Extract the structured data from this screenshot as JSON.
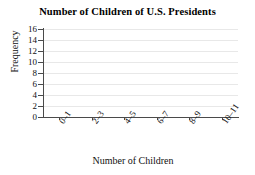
{
  "chart_data": {
    "type": "bar",
    "title": "Number of Children of U.S. Presidents",
    "xlabel": "Number of Children",
    "ylabel": "Frequency",
    "categories": [
      "0–1",
      "2–3",
      "4–5",
      "6–7",
      "8–9",
      "10–11"
    ],
    "values": [
      null,
      null,
      null,
      null,
      null,
      null
    ],
    "series": [
      {
        "name": "Frequency",
        "values": [
          null,
          null,
          null,
          null,
          null,
          null
        ]
      }
    ],
    "ylim": [
      0,
      16
    ],
    "y_ticks": [
      0,
      2,
      4,
      6,
      8,
      10,
      12,
      14,
      16
    ],
    "y_tick_labels": [
      "0",
      "2",
      "4",
      "6",
      "8",
      "10",
      "12",
      "14",
      "16"
    ],
    "x_tick_labels": [
      "0–1",
      "2–3",
      "4–5",
      "6–7",
      "8–9",
      "10–11"
    ],
    "x_tick_label_rotation": -55,
    "grid": true,
    "grid_axis": "y",
    "legend": false,
    "legend_position": "none",
    "bars_drawn": false,
    "annotations": [],
    "colors": {
      "background": "#ffffff",
      "axis": "#4a4a4a",
      "gridline": "#e8e8e8",
      "text": "#111111",
      "title": "#000000"
    }
  }
}
